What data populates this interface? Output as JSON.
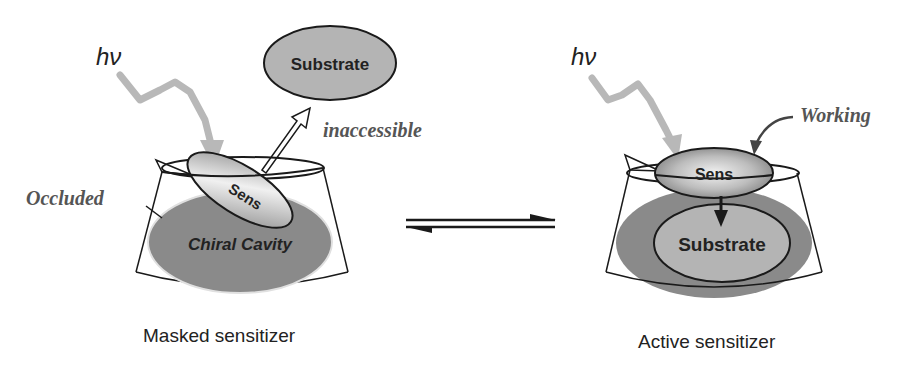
{
  "diagram": {
    "left_panel": {
      "light_label": "hν",
      "substrate_label": "Substrate",
      "inaccessible_label": "inaccessible",
      "occluded_label": "Occluded",
      "sens_label": "Sens",
      "cavity_label": "Chiral Cavity",
      "caption": "Masked sensitizer"
    },
    "right_panel": {
      "light_label": "hν",
      "working_label": "Working",
      "sens_label": "Sens",
      "substrate_label": "Substrate",
      "caption": "Active sensitizer"
    },
    "equilibrium_arrow": "⇌",
    "colors": {
      "cavity_fill": "#8a8a8a",
      "substrate_fill": "#b4b4b4",
      "light_arrow": "#b8b8b8",
      "outline": "#1a1a1a",
      "label_gray": "#555555"
    }
  }
}
